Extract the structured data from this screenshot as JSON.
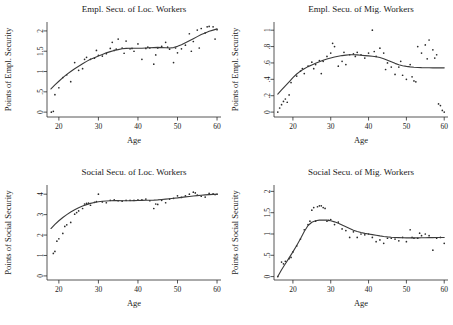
{
  "figure": {
    "background": "#ffffff",
    "point_color": "#2b2b2b",
    "line_color": "#3a3a3a",
    "axis_color": "#2b2b2b"
  },
  "chart_data": [
    {
      "id": "empl-loc",
      "type": "scatter",
      "title": "Empl. Secu. of Loc. Workers",
      "xlabel": "Age",
      "ylabel": "Points of Empl. Security",
      "xlim": [
        17,
        61
      ],
      "ylim": [
        -0.12,
        2.22
      ],
      "xticks": [
        20,
        30,
        40,
        50,
        60
      ],
      "xticklabels": [
        "20",
        "30",
        "40",
        "50",
        "60"
      ],
      "yticks": [
        0,
        0.5,
        1,
        1.5,
        2
      ],
      "yticklabels": [
        "0",
        ".5",
        "1",
        "1.5",
        "2"
      ],
      "grid": false,
      "legend": "none",
      "x": [
        18.1,
        18.6,
        19.0,
        20.0,
        21.0,
        22.0,
        23.0,
        24.0,
        25.0,
        26.0,
        26.5,
        27.0,
        28.0,
        29.0,
        29.5,
        30.0,
        31.0,
        32.0,
        33.0,
        33.5,
        34.0,
        34.5,
        35.0,
        36.0,
        36.5,
        37.0,
        38.0,
        38.5,
        39.0,
        40.0,
        41.0,
        42.0,
        42.5,
        43.0,
        44.0,
        44.5,
        45.0,
        46.0,
        47.0,
        47.5,
        48.0,
        49.0,
        49.5,
        50.0,
        51.0,
        52.0,
        53.0,
        53.5,
        54.0,
        55.0,
        55.5,
        56.0,
        57.0,
        57.5,
        58.0,
        59.0,
        59.5,
        60.0
      ],
      "y": [
        0.0,
        0.02,
        0.43,
        0.6,
        0.85,
        0.92,
        0.75,
        1.22,
        1.03,
        1.07,
        1.3,
        1.35,
        1.3,
        1.33,
        1.52,
        1.4,
        1.38,
        1.44,
        1.57,
        1.72,
        1.52,
        1.55,
        1.8,
        1.58,
        1.45,
        1.75,
        1.56,
        1.57,
        1.5,
        1.68,
        1.3,
        1.57,
        1.6,
        1.58,
        1.18,
        1.41,
        1.58,
        1.62,
        1.72,
        1.6,
        1.55,
        1.22,
        1.58,
        1.46,
        1.56,
        1.65,
        1.93,
        1.5,
        1.74,
        2.02,
        1.58,
        2.06,
        1.95,
        2.1,
        2.11,
        2.1,
        1.8,
        2.03
      ],
      "fit_x": [
        18.0,
        19.0,
        20.0,
        21.0,
        22.0,
        23.0,
        24.0,
        25.0,
        26.0,
        27.0,
        28.0,
        29.0,
        30.0,
        31.0,
        32.0,
        33.0,
        34.0,
        35.0,
        36.0,
        37.0,
        38.0,
        39.0,
        40.0,
        41.0,
        42.0,
        43.0,
        44.0,
        45.0,
        46.0,
        47.0,
        48.0,
        49.0,
        50.0,
        51.0,
        52.0,
        53.0,
        54.0,
        55.0,
        56.0,
        57.0,
        58.0,
        59.0,
        60.0
      ],
      "fit_y": [
        0.57,
        0.67,
        0.76,
        0.85,
        0.93,
        1.0,
        1.07,
        1.13,
        1.19,
        1.25,
        1.3,
        1.34,
        1.38,
        1.42,
        1.46,
        1.49,
        1.52,
        1.54,
        1.56,
        1.57,
        1.575,
        1.575,
        1.575,
        1.575,
        1.58,
        1.585,
        1.59,
        1.595,
        1.59,
        1.585,
        1.58,
        1.59,
        1.62,
        1.66,
        1.71,
        1.76,
        1.81,
        1.86,
        1.91,
        1.95,
        1.99,
        2.02,
        2.05
      ]
    },
    {
      "id": "empl-mig",
      "type": "scatter",
      "title": "Empl. Secu. of Mig. Workers",
      "xlabel": "Age",
      "ylabel": "Points of Empl. Security",
      "xlim": [
        15,
        61
      ],
      "ylim": [
        -0.06,
        1.1
      ],
      "xticks": [
        20,
        30,
        40,
        50,
        60
      ],
      "xticklabels": [
        "20",
        "30",
        "40",
        "50",
        "60"
      ],
      "yticks": [
        0,
        0.2,
        0.4,
        0.6,
        0.8,
        1
      ],
      "yticklabels": [
        "0",
        ".2",
        ".4",
        ".6",
        ".8",
        "1"
      ],
      "grid": false,
      "legend": "none",
      "x": [
        16.0,
        16.5,
        17.0,
        17.5,
        18.0,
        18.5,
        19.0,
        19.5,
        21.0,
        22.0,
        22.5,
        23.0,
        24.0,
        25.0,
        25.5,
        26.0,
        27.0,
        27.5,
        28.0,
        29.0,
        30.0,
        30.5,
        31.0,
        32.0,
        33.0,
        33.5,
        34.0,
        35.0,
        36.0,
        36.5,
        37.0,
        38.0,
        39.0,
        40.0,
        41.0,
        41.5,
        42.0,
        43.0,
        44.0,
        44.5,
        45.0,
        46.0,
        47.0,
        48.0,
        48.5,
        49.0,
        50.0,
        51.0,
        51.5,
        52.0,
        52.5,
        53.0,
        54.0,
        55.0,
        55.5,
        56.0,
        57.0,
        57.5,
        58.0,
        58.5,
        59.0,
        59.5,
        60.0
      ],
      "y": [
        0.0,
        0.05,
        0.09,
        0.13,
        0.16,
        0.12,
        0.21,
        0.36,
        0.44,
        0.5,
        0.53,
        0.47,
        0.56,
        0.61,
        0.53,
        0.58,
        0.63,
        0.47,
        0.62,
        0.68,
        0.72,
        0.84,
        0.8,
        0.56,
        0.62,
        0.73,
        0.58,
        0.7,
        0.71,
        0.68,
        0.73,
        0.7,
        0.66,
        0.72,
        1.0,
        0.74,
        0.68,
        0.78,
        0.72,
        0.52,
        0.6,
        0.55,
        0.46,
        0.55,
        0.62,
        0.45,
        0.4,
        0.58,
        0.43,
        0.38,
        0.37,
        0.8,
        0.72,
        0.82,
        0.65,
        0.88,
        0.76,
        0.66,
        0.7,
        0.1,
        0.08,
        0.02,
        0.0
      ],
      "fit_x": [
        16.0,
        17.0,
        18.0,
        19.0,
        20.0,
        21.0,
        22.0,
        23.0,
        24.0,
        25.0,
        26.0,
        27.0,
        28.0,
        29.0,
        30.0,
        31.0,
        32.0,
        33.0,
        34.0,
        35.0,
        36.0,
        37.0,
        38.0,
        39.0,
        40.0,
        41.0,
        42.0,
        43.0,
        44.0,
        45.0,
        46.0,
        47.0,
        48.0,
        49.0,
        50.0,
        51.0,
        52.0,
        53.0,
        54.0,
        55.0,
        56.0,
        57.0,
        58.0,
        59.0,
        60.0
      ],
      "fit_y": [
        0.22,
        0.27,
        0.32,
        0.37,
        0.42,
        0.465,
        0.5,
        0.53,
        0.555,
        0.575,
        0.595,
        0.615,
        0.632,
        0.648,
        0.66,
        0.672,
        0.682,
        0.69,
        0.696,
        0.7,
        0.7,
        0.698,
        0.694,
        0.69,
        0.686,
        0.682,
        0.676,
        0.666,
        0.652,
        0.634,
        0.614,
        0.595,
        0.578,
        0.566,
        0.558,
        0.552,
        0.548,
        0.545,
        0.543,
        0.542,
        0.541,
        0.54,
        0.54,
        0.54,
        0.54
      ]
    },
    {
      "id": "soc-loc",
      "type": "scatter",
      "title": "Social Secu. of Loc. Workers",
      "xlabel": "Age",
      "ylabel": "Points of Social Security",
      "xlim": [
        17,
        61
      ],
      "ylim": [
        -0.2,
        4.45
      ],
      "xticks": [
        20,
        30,
        40,
        50,
        60
      ],
      "xticklabels": [
        "20",
        "30",
        "40",
        "50",
        "60"
      ],
      "yticks": [
        0,
        1,
        2,
        3,
        4
      ],
      "yticklabels": [
        "0",
        "1",
        "2",
        "3",
        "4"
      ],
      "grid": false,
      "legend": "none",
      "x": [
        18.6,
        19.0,
        19.5,
        20.0,
        21.0,
        21.5,
        22.0,
        23.0,
        24.0,
        24.5,
        25.0,
        26.0,
        26.5,
        27.0,
        27.5,
        28.0,
        29.0,
        29.5,
        30.0,
        31.0,
        32.0,
        33.0,
        34.0,
        35.0,
        36.0,
        37.0,
        38.0,
        39.0,
        40.0,
        41.0,
        42.0,
        43.0,
        44.0,
        44.5,
        45.0,
        46.0,
        47.0,
        48.0,
        49.0,
        50.0,
        51.0,
        52.0,
        53.0,
        54.0,
        54.5,
        55.0,
        56.0,
        57.0,
        58.0,
        59.0,
        59.5,
        60.0
      ],
      "y": [
        1.1,
        1.2,
        1.7,
        1.82,
        2.08,
        2.42,
        2.5,
        2.62,
        3.02,
        3.1,
        3.18,
        3.3,
        3.52,
        3.55,
        3.56,
        3.46,
        3.6,
        3.64,
        4.0,
        3.62,
        3.58,
        3.7,
        3.72,
        3.68,
        3.66,
        3.7,
        3.7,
        3.7,
        3.72,
        3.72,
        3.76,
        3.68,
        3.3,
        3.52,
        3.5,
        3.7,
        3.58,
        3.76,
        3.8,
        3.92,
        3.84,
        3.92,
        4.0,
        4.1,
        4.06,
        3.96,
        3.9,
        3.86,
        4.04,
        4.02,
        3.98,
        4.0
      ],
      "fit_x": [
        18.0,
        19.0,
        20.0,
        21.0,
        22.0,
        23.0,
        24.0,
        25.0,
        26.0,
        27.0,
        28.0,
        29.0,
        30.0,
        31.0,
        32.0,
        33.0,
        34.0,
        35.0,
        36.0,
        37.0,
        38.0,
        39.0,
        40.0,
        41.0,
        42.0,
        43.0,
        44.0,
        45.0,
        46.0,
        47.0,
        48.0,
        49.0,
        50.0,
        51.0,
        52.0,
        53.0,
        54.0,
        55.0,
        56.0,
        57.0,
        58.0,
        59.0,
        60.0
      ],
      "fit_y": [
        2.32,
        2.52,
        2.7,
        2.86,
        3.0,
        3.13,
        3.24,
        3.34,
        3.42,
        3.49,
        3.55,
        3.59,
        3.63,
        3.655,
        3.67,
        3.68,
        3.685,
        3.685,
        3.68,
        3.68,
        3.68,
        3.685,
        3.69,
        3.695,
        3.7,
        3.705,
        3.71,
        3.72,
        3.74,
        3.76,
        3.78,
        3.8,
        3.82,
        3.845,
        3.87,
        3.89,
        3.91,
        3.93,
        3.95,
        3.965,
        3.98,
        3.99,
        4.0
      ]
    },
    {
      "id": "soc-mig",
      "type": "scatter",
      "title": "Social Secu. of Mig. Workers",
      "xlabel": "Age",
      "ylabel": "Points of Social Security",
      "xlim": [
        15,
        61
      ],
      "ylim": [
        -0.08,
        2.15
      ],
      "xticks": [
        20,
        30,
        40,
        50,
        60
      ],
      "xticklabels": [
        "20",
        "30",
        "40",
        "50",
        "60"
      ],
      "yticks": [
        0,
        0.5,
        1,
        1.5,
        2
      ],
      "yticklabels": [
        "0",
        ".5",
        "1",
        "1.5",
        "2"
      ],
      "grid": false,
      "legend": "none",
      "x": [
        16.0,
        17.0,
        17.5,
        18.0,
        19.0,
        19.5,
        20.0,
        21.0,
        22.0,
        23.0,
        24.0,
        24.5,
        25.0,
        25.5,
        26.0,
        26.5,
        27.0,
        27.5,
        28.0,
        28.5,
        29.0,
        29.5,
        30.0,
        31.0,
        32.0,
        33.0,
        34.0,
        35.0,
        36.0,
        37.0,
        38.0,
        39.0,
        40.0,
        41.0,
        42.0,
        43.0,
        44.0,
        45.0,
        46.0,
        47.0,
        48.0,
        49.0,
        50.0,
        51.0,
        51.5,
        52.0,
        53.0,
        53.5,
        54.0,
        55.0,
        56.0,
        57.0,
        58.0,
        59.0,
        60.0
      ],
      "y": [
        0.0,
        0.34,
        0.3,
        0.36,
        0.42,
        0.45,
        0.58,
        0.72,
        0.88,
        1.1,
        1.22,
        1.3,
        1.56,
        1.62,
        1.3,
        1.64,
        1.66,
        1.66,
        1.62,
        1.6,
        1.3,
        1.32,
        1.34,
        1.22,
        1.28,
        1.12,
        1.08,
        0.92,
        1.05,
        0.92,
        1.0,
        0.98,
        1.0,
        0.92,
        0.82,
        0.86,
        0.78,
        0.9,
        0.9,
        0.88,
        0.84,
        0.92,
        0.82,
        1.1,
        0.92,
        0.9,
        0.9,
        1.02,
        0.96,
        1.0,
        0.96,
        0.62,
        0.9,
        0.92,
        0.78
      ],
      "fit_x": [
        16.0,
        17.0,
        18.0,
        19.0,
        20.0,
        21.0,
        22.0,
        23.0,
        24.0,
        25.0,
        26.0,
        27.0,
        28.0,
        29.0,
        30.0,
        31.0,
        32.0,
        33.0,
        34.0,
        35.0,
        36.0,
        37.0,
        38.0,
        39.0,
        40.0,
        41.0,
        42.0,
        43.0,
        44.0,
        45.0,
        46.0,
        47.0,
        48.0,
        49.0,
        50.0,
        51.0,
        52.0,
        53.0,
        54.0,
        55.0,
        56.0,
        57.0,
        58.0,
        59.0,
        60.0
      ],
      "fit_y": [
        0.0,
        0.16,
        0.3,
        0.44,
        0.58,
        0.73,
        0.89,
        1.06,
        1.2,
        1.275,
        1.31,
        1.325,
        1.33,
        1.325,
        1.31,
        1.285,
        1.25,
        1.21,
        1.17,
        1.13,
        1.09,
        1.06,
        1.035,
        1.015,
        1.0,
        0.985,
        0.97,
        0.955,
        0.942,
        0.932,
        0.924,
        0.918,
        0.914,
        0.912,
        0.91,
        0.91,
        0.91,
        0.91,
        0.912,
        0.913,
        0.914,
        0.915,
        0.916,
        0.917,
        0.918
      ]
    }
  ]
}
